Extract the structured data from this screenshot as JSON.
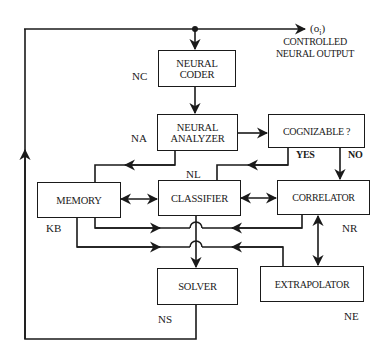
{
  "diagram": {
    "output": {
      "symbol": "(o",
      "subscript": "i",
      "close": ")",
      "line1": "CONTROLLED",
      "line2": "NEURAL OUTPUT"
    },
    "blocks": {
      "coder": {
        "line1": "NEURAL",
        "line2": "CODER",
        "tag": "NC"
      },
      "analyzer": {
        "line1": "NEURAL",
        "line2": "ANALYZER",
        "tag": "NA"
      },
      "cognizable": {
        "label": "COGNIZABLE ?"
      },
      "memory": {
        "label": "MEMORY",
        "tag": "KB"
      },
      "classifier": {
        "label": "CLASSIFIER",
        "tag": "NL"
      },
      "correlator": {
        "label": "CORRELATOR",
        "tag": "NR"
      },
      "solver": {
        "label": "SOLVER",
        "tag": "NS"
      },
      "extrapolator": {
        "label": "EXTRAPOLATOR",
        "tag": "NE"
      }
    },
    "branches": {
      "yes": "YES",
      "no": "NO"
    }
  }
}
